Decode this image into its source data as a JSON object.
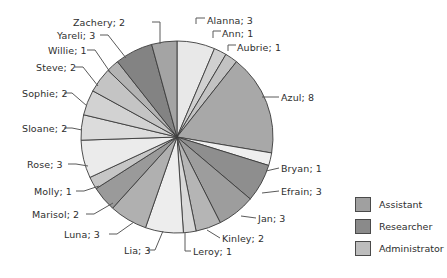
{
  "chart_data": {
    "type": "pie",
    "title": "",
    "categories": [
      "Alanna",
      "Ann",
      "Aubrie",
      "Azul",
      "Bryan",
      "Efrain",
      "Jan",
      "Kinley",
      "Leroy",
      "Lia",
      "Luna",
      "Marisol",
      "Molly",
      "Rose",
      "Sloane",
      "Sophie",
      "Steve",
      "Willie",
      "Yareli",
      "Zachery"
    ],
    "values": [
      3,
      1,
      1,
      8,
      1,
      3,
      3,
      2,
      1,
      3,
      3,
      2,
      1,
      3,
      2,
      2,
      2,
      1,
      3,
      2
    ],
    "total": 48,
    "start_angle_deg": 0,
    "direction": "clockwise",
    "legend_position": "right",
    "grid": false,
    "slices": [
      {
        "label": "Alanna; 3",
        "name": "Alanna",
        "value": 3,
        "color": "#e8e8e8",
        "label_x": 207,
        "label_y": 15,
        "label_align": "right",
        "leader": "M 196 24 L 196 18 L 205 18"
      },
      {
        "label": "Ann; 1",
        "name": "Ann",
        "value": 1,
        "color": "#d0d0d0",
        "label_x": 222,
        "label_y": 28,
        "label_align": "right",
        "leader": "M 213 38 L 213 31 L 221 31"
      },
      {
        "label": "Aubrie; 1",
        "name": "Aubrie",
        "value": 1,
        "color": "#c2c2c2",
        "label_x": 237,
        "label_y": 42,
        "label_align": "right",
        "leader": "M 228 51 L 228 45 L 236 45"
      },
      {
        "label": "Azul; 8",
        "name": "Azul",
        "value": 8,
        "color": "#a8a8a8",
        "label_x": 281,
        "label_y": 92,
        "label_align": "right",
        "leader": "M 262 97 L 279 97"
      },
      {
        "label": "Bryan; 1",
        "name": "Bryan",
        "value": 1,
        "color": "#efefef",
        "label_x": 281,
        "label_y": 163,
        "label_align": "right",
        "leader": "M 266 171 L 279 168"
      },
      {
        "label": "Efrain; 3",
        "name": "Efrain",
        "value": 3,
        "color": "#8e8e8e",
        "label_x": 281,
        "label_y": 186,
        "label_align": "right",
        "leader": "M 262 193 L 279 191"
      },
      {
        "label": "Jan; 3",
        "name": "Jan",
        "value": 3,
        "color": "#9d9d9d",
        "label_x": 258,
        "label_y": 213,
        "label_align": "right",
        "leader": "M 241 216 L 256 218"
      },
      {
        "label": "Kinley; 2",
        "name": "Kinley",
        "value": 2,
        "color": "#b5b5b5",
        "label_x": 222,
        "label_y": 233,
        "label_align": "right",
        "leader": "M 207 230 L 220 238"
      },
      {
        "label": "Leroy; 1",
        "name": "Leroy",
        "value": 1,
        "color": "#d8d8d8",
        "label_x": 193,
        "label_y": 246,
        "label_align": "right",
        "leader": "M 185 233 L 185 251 L 191 251"
      },
      {
        "label": "Lia; 3",
        "name": "Lia",
        "value": 3,
        "color": "#ededed",
        "label_x": 124,
        "label_y": 245,
        "label_align": "left",
        "leader": "M 163 231 L 155 250 L 147 250"
      },
      {
        "label": "Luna; 3",
        "name": "Luna",
        "value": 3,
        "color": "#b0b0b0",
        "label_x": 64,
        "label_y": 229,
        "label_align": "left",
        "leader": "M 134 222 L 117 234 L 109 234"
      },
      {
        "label": "Marisol; 2",
        "name": "Marisol",
        "value": 2,
        "color": "#9a9a9a",
        "label_x": 32,
        "label_y": 209,
        "label_align": "left",
        "leader": "M 113 203 L 94 214 L 86 214"
      },
      {
        "label": "Molly; 1",
        "name": "Molly",
        "value": 1,
        "color": "#c6c6c6",
        "label_x": 34,
        "label_y": 186,
        "label_align": "left",
        "leader": "M 99 186 L 84 191 L 76 191"
      },
      {
        "label": "Rose; 3",
        "name": "Rose",
        "value": 3,
        "color": "#ebebeb",
        "label_x": 27,
        "label_y": 159,
        "label_align": "left",
        "leader": "M 88 166 L 76 164 L 68 164"
      },
      {
        "label": "Sloane; 2",
        "name": "Sloane",
        "value": 2,
        "color": "#dcdcdc",
        "label_x": 22,
        "label_y": 123,
        "label_align": "left",
        "leader": "M 82 130 L 72 128 L 64 128"
      },
      {
        "label": "Sophie; 2",
        "name": "Sophie",
        "value": 2,
        "color": "#d2d2d2",
        "label_x": 22,
        "label_y": 88,
        "label_align": "left",
        "leader": "M 87 106 L 72 93 L 64 93"
      },
      {
        "label": "Steve; 2",
        "name": "Steve",
        "value": 2,
        "color": "#c4c4c4",
        "label_x": 36,
        "label_y": 62,
        "label_align": "left",
        "leader": "M 98 86 L 83 67 L 75 67"
      },
      {
        "label": "Willie; 1",
        "name": "Willie",
        "value": 1,
        "color": "#b3b3b3",
        "label_x": 48,
        "label_y": 45,
        "label_align": "left",
        "leader": "M 110 72 L 95 50 L 87 50"
      },
      {
        "label": "Yareli; 3",
        "name": "Yareli",
        "value": 3,
        "color": "#838383",
        "label_x": 57,
        "label_y": 30,
        "label_align": "left",
        "leader": "M 126 58 L 108 35 L 100 35"
      },
      {
        "label": "Zachery; 2",
        "name": "Zachery",
        "value": 2,
        "color": "#a4a4a4",
        "label_x": 73,
        "label_y": 17,
        "label_align": "left",
        "leader": "M 160 44 L 160 22 L 152 22"
      }
    ],
    "legend": {
      "items": [
        {
          "label": "Assistant",
          "color": "#a0a0a0"
        },
        {
          "label": "Researcher",
          "color": "#8a8a8a"
        },
        {
          "label": "Administrator",
          "color": "#bdbdbd"
        }
      ]
    },
    "geometry": {
      "cx": 177,
      "cy": 137,
      "r": 96
    }
  }
}
